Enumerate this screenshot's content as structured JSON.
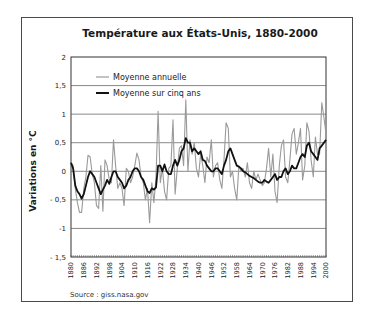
{
  "chart_data": {
    "type": "line",
    "title": "Température aux États-Unis, 1880-2000",
    "xlabel": "",
    "ylabel": "Variations en °C",
    "source": "Source : giss.nasa.gov",
    "ylim": [
      -1.5,
      2
    ],
    "xlim": [
      1880,
      2000
    ],
    "grid": true,
    "legend_position": "top-left",
    "y_ticks": [
      "2",
      "1,5",
      "1",
      "0,5",
      "0",
      "- 0,5",
      "-1",
      "- 1,5"
    ],
    "y_tick_values": [
      2,
      1.5,
      1,
      0.5,
      0,
      -0.5,
      -1,
      -1.5
    ],
    "x_ticks": [
      "1880",
      "1886",
      "1892",
      "1898",
      "1904",
      "1910",
      "1916",
      "1922",
      "1928",
      "1934",
      "1940",
      "1946",
      "1952",
      "1958",
      "1964",
      "1970",
      "1976",
      "1982",
      "1988",
      "1994",
      "2000"
    ],
    "x": [
      1880,
      1881,
      1882,
      1883,
      1884,
      1885,
      1886,
      1887,
      1888,
      1889,
      1890,
      1891,
      1892,
      1893,
      1894,
      1895,
      1896,
      1897,
      1898,
      1899,
      1900,
      1901,
      1902,
      1903,
      1904,
      1905,
      1906,
      1907,
      1908,
      1909,
      1910,
      1911,
      1912,
      1913,
      1914,
      1915,
      1916,
      1917,
      1918,
      1919,
      1920,
      1921,
      1922,
      1923,
      1924,
      1925,
      1926,
      1927,
      1928,
      1929,
      1930,
      1931,
      1932,
      1933,
      1934,
      1935,
      1936,
      1937,
      1938,
      1939,
      1940,
      1941,
      1942,
      1943,
      1944,
      1945,
      1946,
      1947,
      1948,
      1949,
      1950,
      1951,
      1952,
      1953,
      1954,
      1955,
      1956,
      1957,
      1958,
      1959,
      1960,
      1961,
      1962,
      1963,
      1964,
      1965,
      1966,
      1967,
      1968,
      1969,
      1970,
      1971,
      1972,
      1973,
      1974,
      1975,
      1976,
      1977,
      1978,
      1979,
      1980,
      1981,
      1982,
      1983,
      1984,
      1985,
      1986,
      1987,
      1988,
      1989,
      1990,
      1991,
      1992,
      1993,
      1994,
      1995,
      1996,
      1997,
      1998,
      1999,
      2000
    ],
    "series": [
      {
        "name": "Moyenne annuelle",
        "color": "#9a9a9a",
        "values": [
          0.15,
          0.1,
          -0.3,
          -0.55,
          -0.72,
          -0.72,
          -0.3,
          -0.1,
          0.28,
          0.25,
          -0.05,
          -0.2,
          -0.6,
          -0.65,
          0.1,
          -0.7,
          0.2,
          0.1,
          -0.15,
          -0.2,
          0.55,
          0.1,
          -0.3,
          -0.2,
          -0.3,
          -0.6,
          0.05,
          0.0,
          -0.2,
          -0.1,
          0.1,
          0.32,
          0.2,
          -0.1,
          -0.2,
          -0.5,
          -0.3,
          -0.9,
          -0.2,
          -0.55,
          -0.1,
          1.05,
          -0.2,
          0.05,
          -0.35,
          -0.5,
          0.05,
          0.1,
          0.9,
          -0.4,
          0.05,
          0.4,
          0.45,
          0.1,
          1.25,
          0.0,
          0.55,
          0.3,
          0.5,
          0.05,
          -0.1,
          0.3,
          0.1,
          -0.2,
          0.25,
          0.15,
          0.55,
          -0.1,
          0.1,
          0.15,
          -0.15,
          -0.3,
          0.2,
          0.85,
          0.75,
          -0.1,
          0.0,
          -0.3,
          -0.5,
          0.1,
          0.0,
          0.05,
          -0.1,
          0.15,
          -0.2,
          -0.3,
          0.0,
          -0.15,
          -0.05,
          -0.15,
          -0.25,
          -0.2,
          0.05,
          0.4,
          -0.1,
          0.3,
          -0.35,
          -0.55,
          0.1,
          0.45,
          0.55,
          -0.1,
          -0.2,
          0.2,
          0.65,
          0.75,
          0.3,
          0.5,
          0.75,
          -0.15,
          0.1,
          0.85,
          0.7,
          0.2,
          -0.1,
          0.6,
          0.3,
          0.3,
          1.2,
          0.95,
          0.65
        ]
      },
      {
        "name": "Moyenne sur cinq ans",
        "color": "#111111",
        "values": [
          0.15,
          0.05,
          -0.25,
          -0.35,
          -0.4,
          -0.48,
          -0.4,
          -0.25,
          -0.1,
          0.0,
          -0.05,
          -0.1,
          -0.2,
          -0.3,
          -0.4,
          -0.32,
          -0.25,
          -0.15,
          -0.22,
          -0.1,
          0.0,
          0.0,
          -0.1,
          -0.15,
          -0.2,
          -0.3,
          -0.25,
          -0.15,
          -0.1,
          0.0,
          0.05,
          0.05,
          0.0,
          -0.1,
          -0.15,
          -0.25,
          -0.35,
          -0.38,
          -0.3,
          -0.32,
          -0.28,
          0.1,
          0.1,
          0.0,
          0.12,
          0.0,
          -0.05,
          -0.05,
          0.1,
          0.2,
          0.1,
          0.2,
          0.35,
          0.4,
          0.58,
          0.5,
          0.5,
          0.35,
          0.4,
          0.35,
          0.3,
          0.35,
          0.2,
          0.18,
          0.1,
          0.05,
          0.0,
          0.0,
          0.05,
          0.05,
          0.0,
          -0.05,
          0.1,
          0.2,
          0.35,
          0.4,
          0.3,
          0.2,
          0.1,
          0.08,
          0.05,
          0.0,
          -0.02,
          -0.05,
          -0.08,
          -0.1,
          -0.12,
          -0.15,
          -0.18,
          -0.2,
          -0.2,
          -0.15,
          -0.18,
          -0.2,
          -0.15,
          -0.1,
          -0.05,
          -0.15,
          -0.1,
          -0.1,
          0.0,
          0.05,
          -0.05,
          0.0,
          0.1,
          0.05,
          0.05,
          0.15,
          0.25,
          0.3,
          0.25,
          0.45,
          0.5,
          0.35,
          0.3,
          0.25,
          0.2,
          0.4,
          0.45,
          0.5,
          0.55
        ]
      }
    ]
  },
  "legend": {
    "items": [
      {
        "label": "Moyenne annuelle"
      },
      {
        "label": "Moyenne sur cinq ans"
      }
    ]
  }
}
